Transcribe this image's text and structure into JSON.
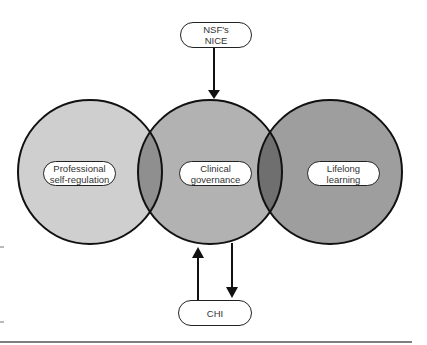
{
  "diagram": {
    "circles": [
      {
        "id": "left",
        "label_lines": [
          "Professional",
          "self-regulation"
        ],
        "fill": "#cfcfcf"
      },
      {
        "id": "middle",
        "label_lines": [
          "Clinical",
          "governance"
        ],
        "fill": "#b2b2b2"
      },
      {
        "id": "right",
        "label_lines": [
          "Lifelong",
          "learning"
        ],
        "fill": "#9e9e9e"
      }
    ],
    "overlaps": [
      {
        "between": [
          "left",
          "middle"
        ],
        "fill": "#8f8f8f"
      },
      {
        "between": [
          "middle",
          "right"
        ],
        "fill": "#6f6f6f"
      }
    ],
    "top_box": {
      "label_lines": [
        "NSF's",
        "NICE"
      ],
      "arrow": "down into Clinical governance"
    },
    "bottom_box": {
      "label_lines": [
        "CHI"
      ],
      "arrows": [
        "up into Clinical governance",
        "down from Clinical governance"
      ]
    }
  }
}
